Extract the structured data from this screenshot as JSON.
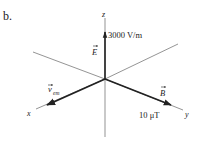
{
  "figure_label": "b.",
  "axes": {
    "x": "x",
    "y": "y",
    "z": "z"
  },
  "vectors": {
    "E": {
      "symbol": "E",
      "magnitude": "3000 V/m",
      "direction": "+z"
    },
    "B": {
      "symbol": "B",
      "magnitude": "10 μT",
      "direction": "+y"
    },
    "v": {
      "symbol": "v",
      "subscript": "em",
      "direction": "+x"
    }
  },
  "colors": {
    "ink": "#222222",
    "axis": "#555555",
    "background": "#ffffff"
  }
}
